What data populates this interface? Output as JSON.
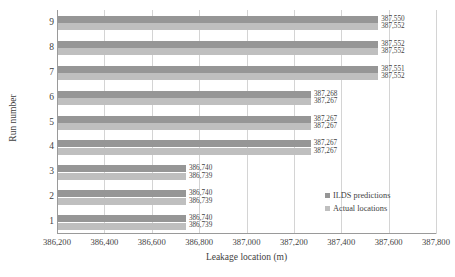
{
  "chart_data": {
    "type": "bar",
    "orientation": "horizontal",
    "title": "",
    "xlabel": "Leakage location (m)",
    "ylabel": "Run number",
    "categories": [
      "1",
      "2",
      "3",
      "4",
      "5",
      "6",
      "7",
      "8",
      "9"
    ],
    "xlim": [
      386200,
      387800
    ],
    "xticks": [
      386200,
      386400,
      386600,
      386800,
      387000,
      387200,
      387400,
      387600,
      387800
    ],
    "xtick_labels": [
      "386,200",
      "386,400",
      "386,600",
      "386,800",
      "387,000",
      "387,200",
      "387,400",
      "387,600",
      "387,800"
    ],
    "grid": "vertical",
    "legend_position": "inside-right",
    "series": [
      {
        "name": "ILDS predictions",
        "color": "#969696",
        "values": [
          386740,
          386740,
          386740,
          387267,
          387267,
          387268,
          387551,
          387552,
          387550
        ],
        "value_labels": [
          "386,740",
          "386,740",
          "386,740",
          "387,267",
          "387,267",
          "387,268",
          "387,551",
          "387,552",
          "387,550"
        ]
      },
      {
        "name": "Actual locations",
        "color": "#bfbfbf",
        "values": [
          386739,
          386739,
          386739,
          387267,
          387267,
          387267,
          387552,
          387552,
          387552
        ],
        "value_labels": [
          "386,739",
          "386,739",
          "386,739",
          "387,267",
          "387,267",
          "387,267",
          "387,552",
          "387,552",
          "387,552"
        ]
      }
    ]
  },
  "legend": {
    "items": [
      {
        "label": "ILDS predictions",
        "color": "#969696"
      },
      {
        "label": "Actual locations",
        "color": "#bfbfbf"
      }
    ]
  }
}
